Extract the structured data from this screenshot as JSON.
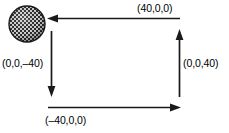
{
  "figure": {
    "background_color": "#ffffff",
    "stroke_color": "#1a1a1a",
    "sphere": {
      "name": "textured-sphere",
      "center_x": 27,
      "center_y": 24,
      "radius": 18,
      "fill_color": "#3a3a3a",
      "pattern": "checkerboard"
    },
    "labels": {
      "top": "(40,0,0)",
      "left": "(0,0,–40)",
      "right": "(0,0,40)",
      "bottom": "(–40,0,0)"
    },
    "arrows": [
      {
        "name": "arrow-top",
        "direction": "left",
        "label": "(40,0,0)",
        "x1": 180,
        "y1": 18,
        "x2": 49,
        "y2": 18
      },
      {
        "name": "arrow-left",
        "direction": "down",
        "label": "(0,0,–40)",
        "x1": 51,
        "y1": 31,
        "x2": 51,
        "y2": 96
      },
      {
        "name": "arrow-bottom",
        "direction": "right",
        "label": "(–40,0,0)",
        "x1": 48,
        "y1": 107,
        "x2": 180,
        "y2": 107
      },
      {
        "name": "arrow-right",
        "direction": "up",
        "label": "(0,0,40)",
        "x1": 179,
        "y1": 96,
        "x2": 179,
        "y2": 29
      }
    ]
  }
}
